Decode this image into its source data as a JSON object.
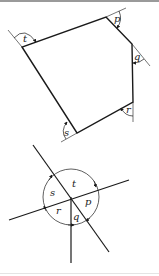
{
  "diagram": {
    "colors": {
      "stroke": "#1a1a1a",
      "background": "#ffffff",
      "border": "#9a9a9a"
    },
    "polygon": {
      "vertices": [
        {
          "name": "p",
          "x": 106,
          "y": 17
        },
        {
          "name": "q",
          "x": 132,
          "y": 44
        },
        {
          "name": "r",
          "x": 133,
          "y": 102
        },
        {
          "name": "s",
          "x": 77,
          "y": 133
        },
        {
          "name": "t",
          "x": 22,
          "y": 47
        }
      ],
      "exterior_angle_labels": {
        "p": "p",
        "q": "q",
        "r": "r",
        "s": "s",
        "t": "t"
      }
    },
    "circle_figure": {
      "center": {
        "x": 71,
        "y": 197
      },
      "radius": 28,
      "angle_labels": {
        "t": "t",
        "s": "s",
        "r": "r",
        "q": "q",
        "p": "p"
      }
    }
  }
}
